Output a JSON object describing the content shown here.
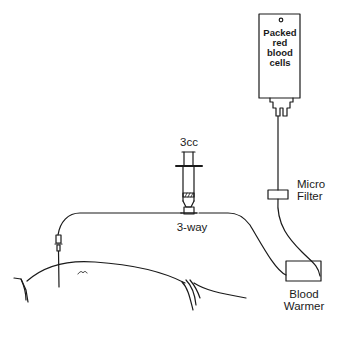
{
  "diagram": {
    "type": "medical-setup-illustration",
    "stroke_color": "#1a1a1a",
    "background": "#ffffff",
    "components": {
      "blood_bag": {
        "label_lines": [
          "Packed",
          "red",
          "blood",
          "cells"
        ]
      },
      "micro_filter": {
        "label_lines": [
          "Micro",
          "Filter"
        ]
      },
      "blood_warmer": {
        "label_lines": [
          "Blood",
          "Warmer"
        ]
      },
      "syringe": {
        "label": "3cc"
      },
      "three_way_stopcock": {
        "label": "3-way"
      },
      "patient": {
        "label": ""
      }
    },
    "connections": [
      {
        "from": "blood_bag",
        "to": "micro_filter"
      },
      {
        "from": "micro_filter",
        "to": "blood_warmer"
      },
      {
        "from": "blood_warmer",
        "to": "three_way_stopcock"
      },
      {
        "from": "syringe",
        "to": "three_way_stopcock"
      },
      {
        "from": "three_way_stopcock",
        "to": "patient"
      }
    ]
  }
}
